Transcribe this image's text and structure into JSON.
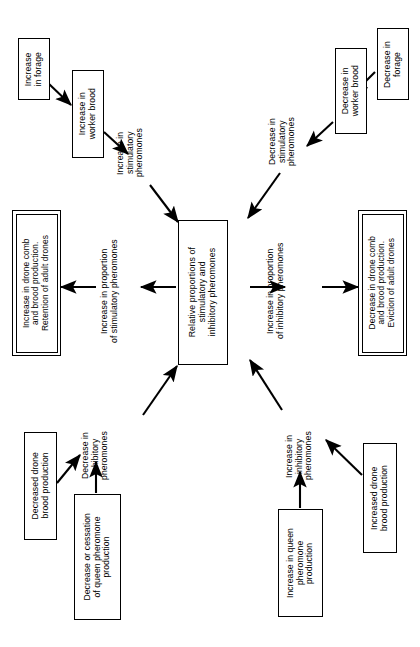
{
  "diagram": {
    "title": "Relative proportions of stimulatory and inhibitory pheromones",
    "orientation": "rotated-90-ccw",
    "colors": {
      "stroke": "#000000",
      "background": "#ffffff",
      "text": "#000000"
    },
    "nodes": {
      "increase_forage": "Increase\nin forage",
      "increase_worker_brood": "Increase in\nworker brood",
      "decrease_forage": "Decrease in\nforage",
      "decrease_worker_brood": "Decrease in\nworker brood",
      "center": "Relative proportions of\nstimulatory and\ninhibitory pheromones",
      "increase_drone_comb": "Increase in drone comb\nand brood production.\nRetention of adult drones",
      "decrease_drone_comb": "Decrease in drone comb\nand brood production.\nEviction of adult drones",
      "decreased_drone_brood": "Decreased drone\nbrood production",
      "decrease_queen_pheromone": "Decrease or cessation\nof queen pheromone\nproduction",
      "increase_queen_pheromone": "Increase in queen\npheromone\nproduction",
      "increased_drone_brood": "Increased drone\nbrood production"
    },
    "edge_labels": {
      "increase_stimulatory_pheromones": "Increase in\nstimulatory\npheromones",
      "decrease_stimulatory_pheromones": "Decrease in\nstimulatory\npheromones",
      "increase_proportion_stimulatory": "Increase in proportion\nof stimulatory pheromones",
      "increase_proportion_inhibitory": "Increase in proportion\nof inhibitory pheromones",
      "decrease_inhibitory_pheromones": "Decrease in\ninhibitory\npheromones",
      "increase_inhibitory_pheromones": "Increase in\ninhibitory\npheromones"
    }
  }
}
